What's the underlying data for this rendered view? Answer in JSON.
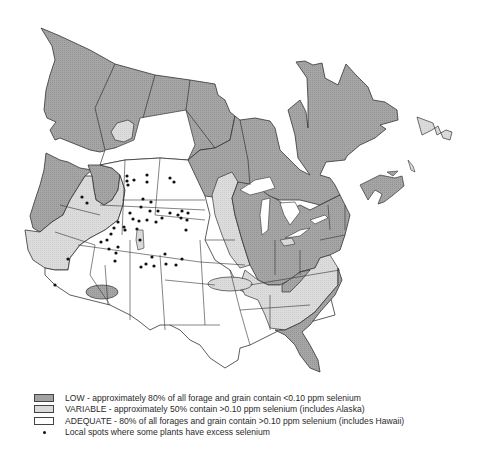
{
  "map": {
    "title": "Selenium distribution in forage and grain, North America",
    "colors": {
      "low": "#a2a2a2",
      "variable": "#dadada",
      "adequate": "#ffffff",
      "border": "#333333",
      "dot": "#111111"
    }
  },
  "legend": {
    "items": [
      {
        "key": "low",
        "swatch": "dark-gray",
        "label": "LOW - approximately 80% of all forage and grain contain <0.10 ppm selenium"
      },
      {
        "key": "variable",
        "swatch": "light-gray",
        "label": "VARIABLE - approximately 50% contain >0.10 ppm selenium (includes Alaska)"
      },
      {
        "key": "adequate",
        "swatch": "white",
        "label": "ADEQUATE - 80% of all forages and grain contain >0.10 ppm selenium (includes Hawaii)"
      },
      {
        "key": "excess",
        "swatch": "dot",
        "label": "Local spots where some plants have excess selenium"
      }
    ]
  }
}
